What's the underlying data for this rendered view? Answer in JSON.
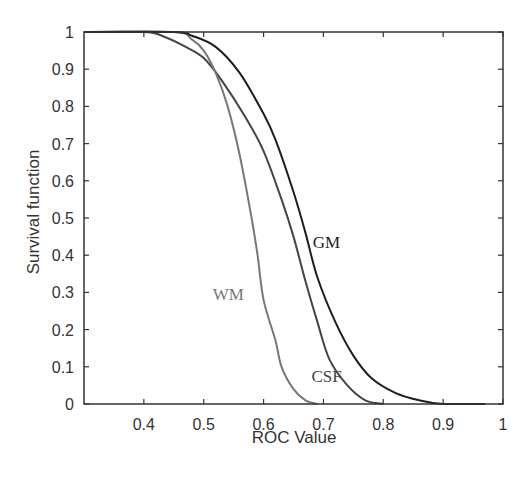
{
  "chart_data": {
    "type": "line",
    "title": "",
    "xlabel": "ROC Value",
    "ylabel": "Survival function",
    "xlim": [
      0.3,
      1.0
    ],
    "ylim": [
      0,
      1
    ],
    "grid": false,
    "legend": "inline labels",
    "xticks": [
      0.4,
      0.5,
      0.6,
      0.7,
      0.8,
      0.9,
      1
    ],
    "xtick_labels": [
      "0.4",
      "0.5",
      "0.6",
      "0.7",
      "0.8",
      "0.9",
      "1"
    ],
    "yticks": [
      0,
      0.1,
      0.2,
      0.3,
      0.4,
      0.5,
      0.6,
      0.7,
      0.8,
      0.9,
      1
    ],
    "ytick_labels": [
      "0",
      "0.1",
      "0.2",
      "0.3",
      "0.4",
      "0.5",
      "0.6",
      "0.7",
      "0.8",
      "0.9",
      "1"
    ],
    "series": [
      {
        "name": "CSF",
        "color": "#444444",
        "label_pos": [
          0.68,
          0.06
        ],
        "x": [
          0.3,
          0.4,
          0.43,
          0.47,
          0.5,
          0.53,
          0.57,
          0.6,
          0.63,
          0.65,
          0.67,
          0.69,
          0.71,
          0.74,
          0.77,
          0.8
        ],
        "y": [
          1.0,
          1.0,
          0.99,
          0.96,
          0.93,
          0.87,
          0.77,
          0.68,
          0.55,
          0.45,
          0.33,
          0.22,
          0.12,
          0.05,
          0.01,
          0.0
        ]
      },
      {
        "name": "WM",
        "color": "#777777",
        "label_pos": [
          0.515,
          0.28
        ],
        "x": [
          0.3,
          0.45,
          0.48,
          0.5,
          0.52,
          0.54,
          0.56,
          0.58,
          0.59,
          0.6,
          0.62,
          0.63,
          0.65,
          0.67,
          0.69
        ],
        "y": [
          1.0,
          1.0,
          0.98,
          0.95,
          0.89,
          0.8,
          0.67,
          0.5,
          0.4,
          0.28,
          0.17,
          0.1,
          0.04,
          0.01,
          0.0
        ]
      },
      {
        "name": "GM",
        "color": "#1e1e1e",
        "label_pos": [
          0.682,
          0.42
        ],
        "x": [
          0.3,
          0.45,
          0.48,
          0.52,
          0.56,
          0.6,
          0.62,
          0.65,
          0.67,
          0.69,
          0.72,
          0.75,
          0.78,
          0.82,
          0.86,
          0.9,
          0.97
        ],
        "y": [
          1.0,
          1.0,
          0.99,
          0.96,
          0.89,
          0.78,
          0.71,
          0.57,
          0.46,
          0.34,
          0.22,
          0.13,
          0.07,
          0.03,
          0.01,
          0.0,
          0.0
        ]
      }
    ]
  }
}
